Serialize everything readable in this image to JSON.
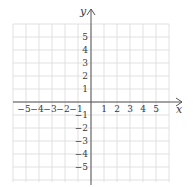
{
  "chart_data": {
    "type": "scatter",
    "title": "",
    "xlabel": "x",
    "ylabel": "y",
    "xlim": [
      -6,
      6
    ],
    "ylim": [
      -6,
      6
    ],
    "grid": true,
    "x_ticks": [
      "-5",
      "-4",
      "-3",
      "-2",
      "-1",
      "1",
      "2",
      "3",
      "4",
      "5"
    ],
    "y_ticks": [
      "5",
      "4",
      "3",
      "2",
      "1",
      "-1",
      "-2",
      "-3",
      "-4",
      "-5"
    ],
    "series": []
  },
  "labels": {
    "x_axis": "x",
    "y_axis": "y"
  },
  "colors": {
    "grid": "#d9d9d9",
    "axis": "#555555",
    "text": "#3a3a3a"
  }
}
